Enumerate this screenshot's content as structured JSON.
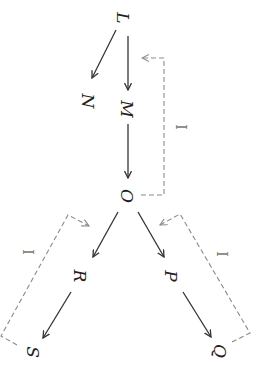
{
  "diagram": {
    "orientation": "rotated 90deg clockwise",
    "nodes": [
      {
        "id": "L",
        "label": "L",
        "x": 123,
        "y": 18
      },
      {
        "id": "N",
        "label": "N",
        "x": 88,
        "y": 101
      },
      {
        "id": "M",
        "label": "M",
        "x": 127,
        "y": 109
      },
      {
        "id": "O",
        "label": "O",
        "x": 127,
        "y": 196
      },
      {
        "id": "R",
        "label": "R",
        "x": 80,
        "y": 276
      },
      {
        "id": "P",
        "label": "P",
        "x": 171,
        "y": 276
      },
      {
        "id": "S",
        "label": "S",
        "x": 33,
        "y": 352
      },
      {
        "id": "Q",
        "label": "Q",
        "x": 220,
        "y": 351
      }
    ],
    "edges": [
      {
        "from": "L",
        "to": "N",
        "style": "solid"
      },
      {
        "from": "L",
        "to": "M",
        "style": "solid"
      },
      {
        "from": "M",
        "to": "O",
        "style": "solid"
      },
      {
        "from": "O",
        "to": "R",
        "style": "solid"
      },
      {
        "from": "O",
        "to": "P",
        "style": "solid"
      },
      {
        "from": "R",
        "to": "S",
        "style": "solid"
      },
      {
        "from": "P",
        "to": "Q",
        "style": "solid"
      }
    ],
    "feedback_loops": [
      {
        "from": "O",
        "to": "M",
        "style": "dashed",
        "label": "I"
      },
      {
        "from": "S",
        "to": "R",
        "style": "dashed",
        "label": "I"
      },
      {
        "from": "Q",
        "to": "P",
        "style": "dashed",
        "label": "I"
      }
    ],
    "colors": {
      "solid_edge": "#333333",
      "dashed_edge": "#8a8a8a",
      "text": "#222222"
    }
  }
}
